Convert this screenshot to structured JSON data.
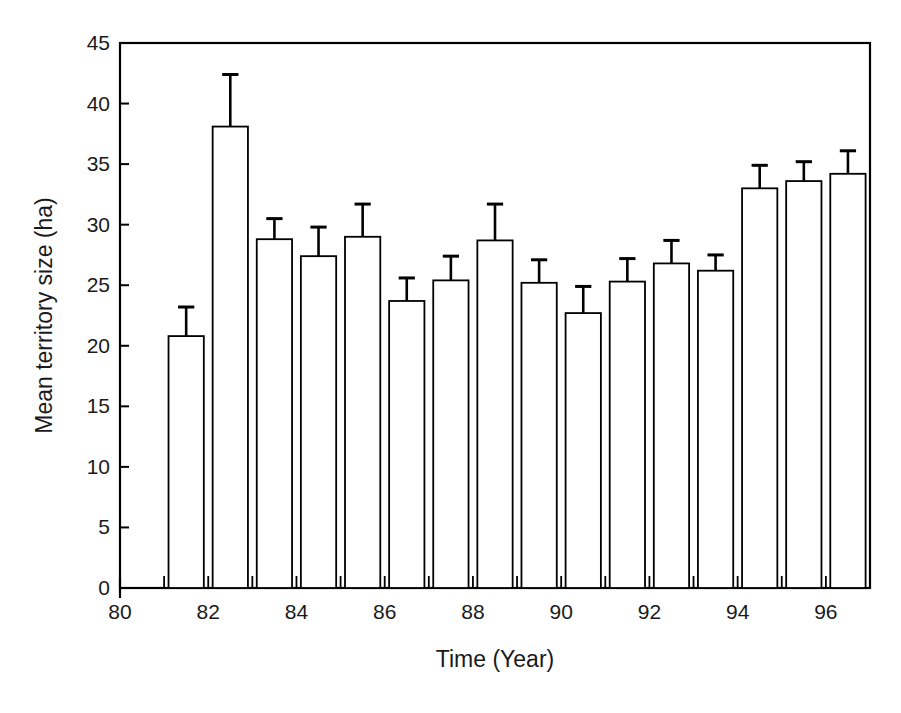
{
  "chart_data": {
    "type": "bar",
    "title": "",
    "xlabel": "Time (Year)",
    "ylabel": "Mean territory size (ha)",
    "xlim": [
      80,
      97
    ],
    "ylim": [
      0,
      45
    ],
    "ytick_values": [
      0,
      5,
      10,
      15,
      20,
      25,
      30,
      35,
      40,
      45
    ],
    "ytick_labels": [
      "0",
      "5",
      "10",
      "15",
      "20",
      "25",
      "30",
      "35",
      "40",
      "45"
    ],
    "xtick_values": [
      80,
      82,
      84,
      86,
      88,
      90,
      92,
      94,
      96
    ],
    "xtick_labels": [
      "80",
      "82",
      "84",
      "86",
      "88",
      "90",
      "92",
      "94",
      "96"
    ],
    "grid": false,
    "legend": "none",
    "bar_fill": "#ffffff",
    "bar_edge": "#000000",
    "error_color": "#000000",
    "categories": [
      81,
      82,
      83,
      84,
      85,
      86,
      87,
      88,
      89,
      90,
      91,
      92,
      93,
      94,
      95,
      96
    ],
    "category_labels": [
      "81",
      "82",
      "83",
      "84",
      "85",
      "86",
      "87",
      "88",
      "89",
      "90",
      "91",
      "92",
      "93",
      "94",
      "95",
      "96"
    ],
    "values": [
      20.8,
      38.1,
      28.8,
      27.4,
      29.0,
      23.7,
      25.4,
      28.7,
      25.2,
      22.7,
      25.3,
      26.8,
      26.2,
      33.0,
      33.6,
      34.2
    ],
    "errors": [
      2.4,
      4.3,
      1.7,
      2.4,
      2.7,
      1.9,
      2.0,
      3.0,
      1.9,
      2.2,
      1.9,
      1.9,
      1.3,
      1.9,
      1.6,
      1.9
    ],
    "error_type": "symmetric-upper-only"
  }
}
